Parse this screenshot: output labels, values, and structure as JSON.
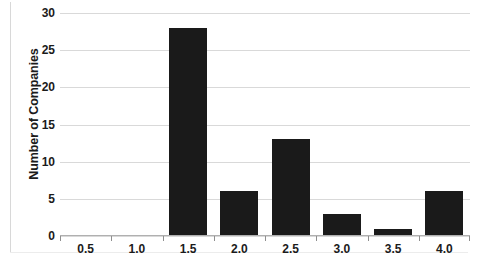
{
  "chart_data": {
    "type": "bar",
    "title": "",
    "subtitle": "",
    "xlabel": "",
    "ylabel": "Number of Companies",
    "categories": [
      "0.5",
      "1.0",
      "1.5",
      "2.0",
      "2.5",
      "3.0",
      "3.5",
      "4.0"
    ],
    "values": [
      0,
      0,
      28,
      6,
      13,
      3,
      1,
      6
    ],
    "ylim": [
      0,
      30
    ],
    "yticks": [
      0,
      5,
      10,
      15,
      20,
      25,
      30
    ],
    "ytick_labels": [
      "0",
      "5",
      "10",
      "15",
      "20",
      "25",
      "30"
    ],
    "xtick_labels": [
      "0.5",
      "1.0",
      "1.5",
      "2.0",
      "2.5",
      "3.0",
      "3.5",
      "4.0"
    ],
    "grid": "horizontal",
    "legend": "none",
    "bar_color": "#1a1a1a",
    "gridline_color": "#d9d9d9",
    "background_color": "#ffffff",
    "annotations": []
  }
}
